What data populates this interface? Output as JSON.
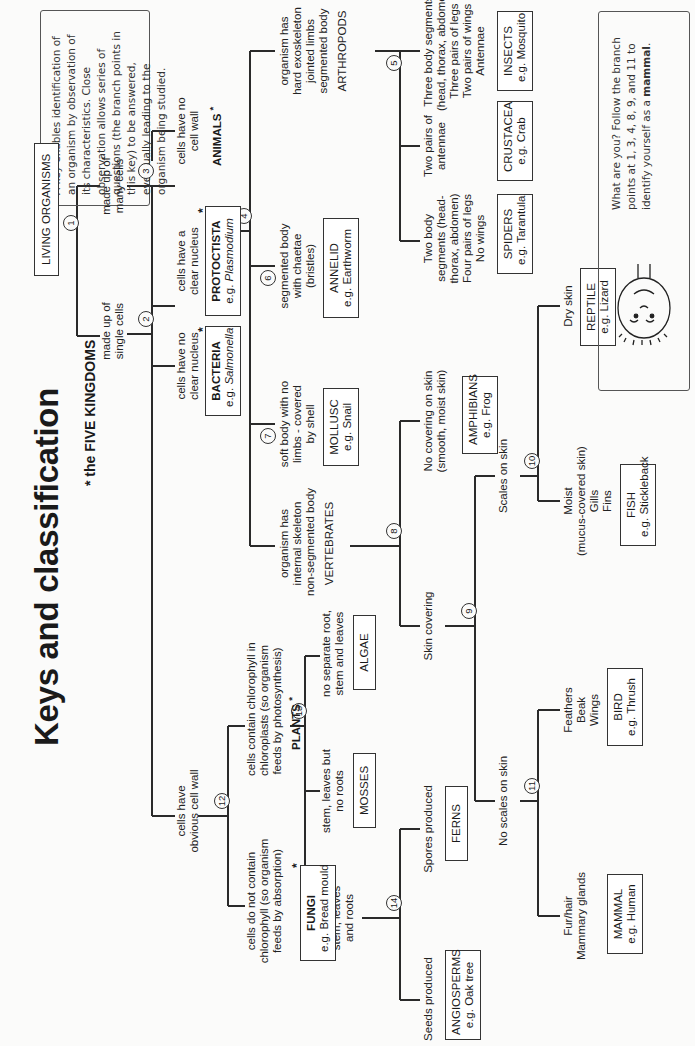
{
  "page": {
    "title": "Keys and classification",
    "subtitle": "* the FIVE KINGDOMS",
    "intro_note": "A key enables identification of an organism by observation of its characteristics. Close observation allows series of questions (the branch points in this key) to be answered, eventually leading to the organism being studied.",
    "footer_note_prefix": "What are you? Follow the branch points at 1, 3, 4, 8, 9, and 11 to identify yourself as a ",
    "footer_note_bold": "mammal",
    "footer_note_suffix": "."
  },
  "key": {
    "root": "LIVING ORGANISMS",
    "branch_points": [
      "1",
      "2",
      "3",
      "4",
      "5",
      "6",
      "7",
      "8",
      "9",
      "10",
      "11",
      "12",
      "13",
      "14"
    ],
    "criteria": {
      "single_cells": [
        "made up of",
        "single cells"
      ],
      "many_cells": [
        "made up of",
        "many cells"
      ],
      "no_nucleus": [
        "cells have no",
        "clear nucleus"
      ],
      "clear_nucleus": [
        "cells have a",
        "clear nucleus"
      ],
      "no_cell_wall": [
        "cells have no",
        "cell wall"
      ],
      "obvious_cell_wall": [
        "cells have",
        "obvious cell wall"
      ],
      "chlorophyll": [
        "cells contain chlorophyll in",
        "chloroplasts (so organism",
        "feeds by photosynthesis)"
      ],
      "no_chlorophyll": [
        "cells do not contain",
        "chlorophyll (so organism",
        "feeds by absorption)"
      ],
      "no_root": [
        "no separate root,",
        "stem and leaves"
      ],
      "no_roots": [
        "stem, leaves but",
        "no roots"
      ],
      "roots": [
        "stem, leaves",
        "and roots"
      ],
      "spores": "Spores produced",
      "seeds": "Seeds produced",
      "exoskeleton": [
        "organism has",
        "hard exoskeleton",
        "jointed limbs",
        "segmented body",
        "ARTHROPODS"
      ],
      "chaetae": [
        "segmented body",
        "with chaetae",
        "(bristles)"
      ],
      "soft_body": [
        "soft body with no",
        "limbs - covered",
        "by shell"
      ],
      "internal_skeleton": [
        "organism has",
        "internal skeleton",
        "non-segmented body",
        "VERTEBRATES"
      ],
      "three_segments": [
        "Three body segments",
        "(head, thorax, abdomen)",
        "Three pairs of legs",
        "Two pairs of wings",
        "Antennae"
      ],
      "two_antennae": [
        "Two pairs of",
        "antennae"
      ],
      "two_segments": [
        "Two body",
        "segments (head-",
        "thorax, abdomen)",
        "Four pairs of legs",
        "No wings"
      ],
      "no_covering": [
        "No covering on skin",
        "(smooth, moist skin)"
      ],
      "skin_covering": "Skin covering",
      "scales": "Scales on skin",
      "no_scales": "No scales on skin",
      "dry_skin": "Dry skin",
      "moist": [
        "Moist",
        "(mucus-covered skin)",
        "Gills",
        "Fins"
      ],
      "feathers": [
        "Feathers",
        "Beak",
        "Wings"
      ],
      "fur": [
        "Fur/hair",
        "Mammary glands"
      ]
    },
    "kingdom_labels": {
      "animals": "ANIMALS",
      "plants": "PLANTS",
      "star": "*"
    },
    "groups": {
      "bacteria": {
        "name": "BACTERIA",
        "example_prefix": "e.g. ",
        "example": "Salmonella"
      },
      "protoctista": {
        "name": "PROTOCTISTA",
        "example_prefix": "e.g. ",
        "example": "Plasmodium"
      },
      "fungi": {
        "name": "FUNGI",
        "example": "e.g. Bread mould"
      },
      "algae": {
        "name": "ALGAE"
      },
      "mosses": {
        "name": "MOSSES"
      },
      "ferns": {
        "name": "FERNS"
      },
      "angiosperms": {
        "name": "ANGIOSPERMS",
        "example": "e.g. Oak tree"
      },
      "insects": {
        "name": "INSECTS",
        "example": "e.g. Mosquito"
      },
      "crustacea": {
        "name": "CRUSTACEA",
        "example": "e.g. Crab"
      },
      "spiders": {
        "name": "SPIDERS",
        "example": "e.g. Tarantula"
      },
      "annelid": {
        "name": "ANNELID",
        "example": "e.g. Earthworm"
      },
      "mollusc": {
        "name": "MOLLUSC",
        "example": "e.g. Snail"
      },
      "amphibians": {
        "name": "AMPHIBIANS",
        "example": "e.g. Frog"
      },
      "reptile": {
        "name": "REPTILE",
        "example": "e.g. Lizard"
      },
      "fish": {
        "name": "FISH",
        "example": "e.g. Stickleback"
      },
      "bird": {
        "name": "BIRD",
        "example": "e.g. Thrush"
      },
      "mammal": {
        "name": "MAMMAL",
        "example": "e.g. Human"
      }
    }
  }
}
